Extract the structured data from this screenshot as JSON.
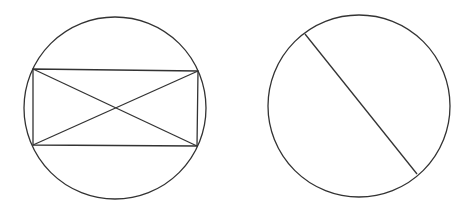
{
  "canvas": {
    "width": 472,
    "height": 224,
    "background": "#ffffff",
    "stroke_color": "#333333"
  },
  "figures": [
    {
      "name": "circle-with-inscribed-rectangle",
      "circle": {
        "cx": 115,
        "cy": 108,
        "r": 91
      },
      "rectangle": {
        "corners": [
          [
            33,
            69
          ],
          [
            198,
            71
          ],
          [
            197,
            146
          ],
          [
            33,
            145
          ]
        ]
      },
      "diagonals": [
        {
          "x1": 33,
          "y1": 69,
          "x2": 197,
          "y2": 146
        },
        {
          "x1": 33,
          "y1": 145,
          "x2": 198,
          "y2": 71
        }
      ]
    },
    {
      "name": "circle-with-chord",
      "circle": {
        "cx": 359,
        "cy": 106,
        "r": 91
      },
      "chord": {
        "x1": 305,
        "y1": 34,
        "x2": 417,
        "y2": 174
      }
    }
  ]
}
